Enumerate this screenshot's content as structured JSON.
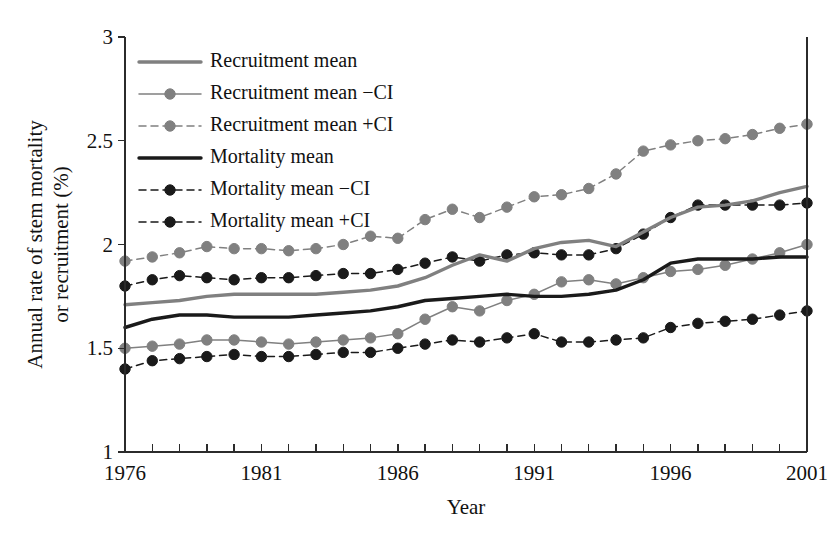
{
  "chart_data": {
    "type": "line",
    "title": "",
    "xlabel": "Year",
    "ylabel_line1": "Annual rate of stem mortality",
    "ylabel_line2": "or recruitment (%)",
    "xlim": [
      1976,
      2001
    ],
    "ylim": [
      1,
      3
    ],
    "yticks": [
      1,
      1.5,
      2,
      2.5,
      3
    ],
    "ytick_labels": [
      "1",
      "1.5",
      "2",
      "2.5",
      "3"
    ],
    "xticks": [
      1976,
      1977,
      1978,
      1979,
      1980,
      1981,
      1982,
      1983,
      1984,
      1985,
      1986,
      1987,
      1988,
      1989,
      1990,
      1991,
      1992,
      1993,
      1994,
      1995,
      1996,
      1997,
      1998,
      1999,
      2000,
      2001
    ],
    "xtick_labels_shown": [
      "1976",
      "1981",
      "1986",
      "1991",
      "1996",
      "2001"
    ],
    "xtick_labels_years": [
      1976,
      1981,
      1986,
      1991,
      1996,
      2001
    ],
    "grid": false,
    "legend_position": "top-left-inside",
    "x": [
      1976,
      1977,
      1978,
      1979,
      1980,
      1981,
      1982,
      1983,
      1984,
      1985,
      1986,
      1987,
      1988,
      1989,
      1990,
      1991,
      1992,
      1993,
      1994,
      1995,
      1996,
      1997,
      1998,
      1999,
      2000,
      2001
    ],
    "series": [
      {
        "name": "Recruitment mean",
        "key": "recruitment-mean",
        "color": "#808080",
        "style": "solid",
        "width": 3.4,
        "marker": "none",
        "values": [
          1.71,
          1.72,
          1.73,
          1.75,
          1.76,
          1.76,
          1.76,
          1.76,
          1.77,
          1.78,
          1.8,
          1.84,
          1.9,
          1.95,
          1.92,
          1.98,
          2.01,
          2.02,
          1.99,
          2.06,
          2.13,
          2.18,
          2.19,
          2.21,
          2.25,
          2.28
        ]
      },
      {
        "name": "Recruitment mean −CI",
        "key": "recruitment-mean-minus-ci",
        "color": "#808080",
        "style": "solid",
        "width": 1.5,
        "marker": "circle",
        "values": [
          1.5,
          1.51,
          1.52,
          1.54,
          1.54,
          1.53,
          1.52,
          1.53,
          1.54,
          1.55,
          1.57,
          1.64,
          1.7,
          1.68,
          1.73,
          1.76,
          1.82,
          1.83,
          1.81,
          1.84,
          1.87,
          1.88,
          1.9,
          1.93,
          1.96,
          2.0
        ]
      },
      {
        "name": "Recruitment mean +CI",
        "key": "recruitment-mean-plus-ci",
        "color": "#808080",
        "style": "dashed",
        "width": 1.5,
        "marker": "circle",
        "values": [
          1.92,
          1.94,
          1.96,
          1.99,
          1.98,
          1.98,
          1.97,
          1.98,
          2.0,
          2.04,
          2.03,
          2.12,
          2.17,
          2.13,
          2.18,
          2.23,
          2.24,
          2.27,
          2.34,
          2.45,
          2.48,
          2.5,
          2.51,
          2.53,
          2.56,
          2.58
        ]
      },
      {
        "name": "Mortality mean",
        "key": "mortality-mean",
        "color": "#1a1a1a",
        "style": "solid",
        "width": 3.4,
        "marker": "none",
        "values": [
          1.6,
          1.64,
          1.66,
          1.66,
          1.65,
          1.65,
          1.65,
          1.66,
          1.67,
          1.68,
          1.7,
          1.73,
          1.74,
          1.75,
          1.76,
          1.75,
          1.75,
          1.76,
          1.78,
          1.83,
          1.91,
          1.93,
          1.93,
          1.93,
          1.94,
          1.94
        ]
      },
      {
        "name": "Mortality mean −CI",
        "key": "mortality-mean-minus-ci",
        "color": "#1a1a1a",
        "style": "dashed",
        "width": 1.5,
        "marker": "circle",
        "values": [
          1.4,
          1.44,
          1.45,
          1.46,
          1.47,
          1.46,
          1.46,
          1.47,
          1.48,
          1.48,
          1.5,
          1.52,
          1.54,
          1.53,
          1.55,
          1.57,
          1.53,
          1.53,
          1.54,
          1.55,
          1.6,
          1.62,
          1.63,
          1.64,
          1.66,
          1.68
        ]
      },
      {
        "name": "Mortality mean +CI",
        "key": "mortality-mean-plus-ci",
        "color": "#1a1a1a",
        "style": "dashed",
        "width": 1.5,
        "marker": "circle",
        "values": [
          1.8,
          1.83,
          1.85,
          1.84,
          1.83,
          1.84,
          1.84,
          1.85,
          1.86,
          1.86,
          1.88,
          1.91,
          1.94,
          1.92,
          1.95,
          1.96,
          1.95,
          1.95,
          1.98,
          2.05,
          2.13,
          2.19,
          2.19,
          2.19,
          2.19,
          2.2
        ]
      }
    ],
    "legend": [
      "Recruitment mean",
      "Recruitment mean −CI",
      "Recruitment mean +CI",
      "Mortality mean",
      "Mortality mean −CI",
      "Mortality mean +CI"
    ]
  }
}
